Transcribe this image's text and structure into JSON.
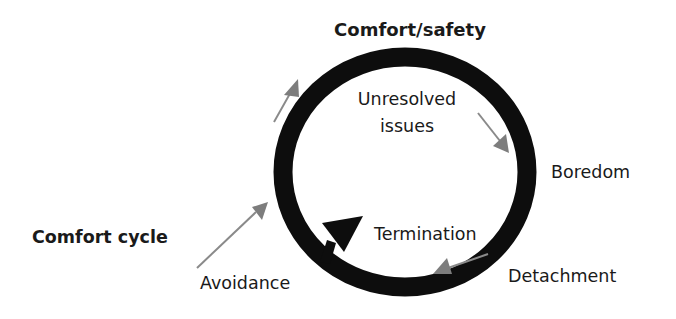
{
  "diagram": {
    "title": "Comfort cycle",
    "top_label": "Comfort/safety",
    "stages": [
      {
        "id": "unresolved",
        "lines": [
          "Unresolved",
          "issues"
        ]
      },
      {
        "id": "boredom",
        "label": "Boredom"
      },
      {
        "id": "detachment",
        "label": "Detachment"
      },
      {
        "id": "termination",
        "label": "Termination"
      },
      {
        "id": "avoidance",
        "label": "Avoidance"
      }
    ],
    "colors": {
      "ring": "#0d0d0d",
      "arrow_gray": "#8a8a8a",
      "text": "#1a1a1a",
      "background": "#ffffff"
    }
  }
}
